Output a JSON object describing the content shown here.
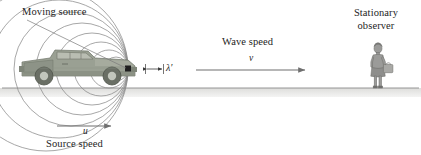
{
  "figure": {
    "topic": "doppler-effect-moving-source",
    "background_color": "#ffffff",
    "ground_line_color": "#8b8b8b",
    "ground_band_color": "#e4e4e2",
    "wavefront_color": "#8a8a8a",
    "arrow_color": "#6f6f6f",
    "leader_line_color": "#7a7a7a",
    "text_color": "#1d1d1d",
    "truck_body_color": "#9aa093",
    "truck_shade_color": "#7e8478",
    "observer_color": "#9b9b99"
  },
  "labels": {
    "moving_source": "Moving source",
    "stationary_observer": "Stationary observer",
    "wave_speed": "Wave speed",
    "source_speed": "Source speed"
  },
  "symbols": {
    "wavelength_prime": "λ′",
    "wave_speed_symbol": "v",
    "source_speed_symbol": "u"
  },
  "diagram": {
    "source_point": {
      "x": 128,
      "y": 69
    },
    "wavefront_count": 9,
    "wavefront_radii": [
      6,
      12,
      19,
      27,
      36,
      46,
      57,
      69,
      82
    ],
    "ground_line_y": 88,
    "wave_speed_arrow": {
      "x1": 196,
      "y1": 70,
      "x2": 311,
      "y2": 70
    },
    "source_speed_arrow": {
      "x1": 57,
      "y1": 126,
      "x2": 117,
      "y2": 126
    },
    "wavelength_arrow": {
      "x1": 146,
      "y1": 69,
      "x2": 163,
      "y2": 69
    },
    "leader_line": {
      "x1": 27,
      "y1": 20,
      "x2": 126,
      "y2": 68
    }
  }
}
